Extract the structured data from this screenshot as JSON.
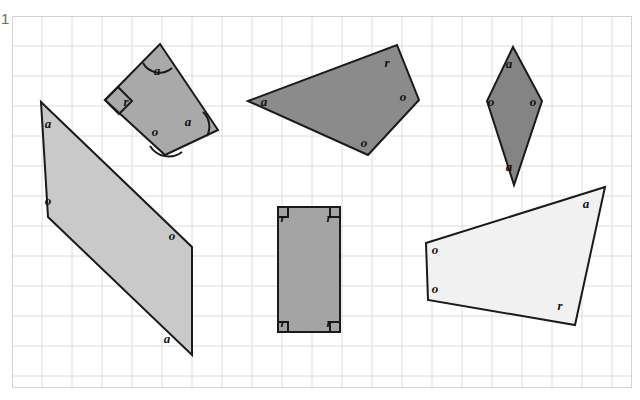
{
  "worksheet": {
    "question_number": "1",
    "grid": {
      "cell_size": 30,
      "line_color": "#dcdcdc",
      "border_color": "#d2d2d2",
      "origin_x": 12,
      "origin_y": 16,
      "width": 620,
      "height": 372
    },
    "legend_meaning": {
      "a": "acute angle",
      "o": "obtuse angle",
      "r": "right angle"
    },
    "shapes": [
      {
        "name": "shape-quadrilateral-top-left",
        "fill": "#a9a9a9",
        "stroke": "#1a1a1a",
        "points": "148,28 206,114 153,139 93,84",
        "labels": [
          {
            "text": "a",
            "x": 145,
            "y": 59
          },
          {
            "text": "r",
            "x": 114,
            "y": 90
          },
          {
            "text": "o",
            "x": 143,
            "y": 120
          },
          {
            "text": "a",
            "x": 176,
            "y": 110
          }
        ],
        "arcs": [
          {
            "d": "M 131 47 A 19 19 0 0 0 160 52"
          },
          {
            "d": "M 138 130 A 22 22 0 0 0 170 136"
          },
          {
            "d": "M 191 96 A 20 20 0 0 1 195 120"
          }
        ],
        "right_angle_marks": [
          {
            "points": "93,84 106,71 120,85 107,98"
          }
        ]
      },
      {
        "name": "shape-parallelogram-left",
        "fill": "#c9c9c9",
        "stroke": "#1a1a1a",
        "points": "29,86 180,231 180,339 36,201",
        "labels": [
          {
            "text": "a",
            "x": 36,
            "y": 112
          },
          {
            "text": "o",
            "x": 36,
            "y": 189
          },
          {
            "text": "o",
            "x": 160,
            "y": 224
          },
          {
            "text": "a",
            "x": 155,
            "y": 327
          }
        ],
        "arcs": [],
        "right_angle_marks": []
      },
      {
        "name": "shape-quadrilateral-top-middle",
        "fill": "#8b8b8b",
        "stroke": "#1a1a1a",
        "points": "236,85 385,29 407,84 356,139",
        "labels": [
          {
            "text": "a",
            "x": 252,
            "y": 90
          },
          {
            "text": "r",
            "x": 375,
            "y": 51
          },
          {
            "text": "o",
            "x": 391,
            "y": 85
          },
          {
            "text": "o",
            "x": 352,
            "y": 131
          }
        ],
        "arcs": [],
        "right_angle_marks": []
      },
      {
        "name": "shape-kite-top-right",
        "fill": "#848484",
        "stroke": "#1a1a1a",
        "points": "501,31 530,85 502,169 475,85",
        "labels": [
          {
            "text": "a",
            "x": 497,
            "y": 52
          },
          {
            "text": "o",
            "x": 479,
            "y": 90
          },
          {
            "text": "o",
            "x": 521,
            "y": 90
          },
          {
            "text": "a",
            "x": 497,
            "y": 155
          }
        ],
        "arcs": [],
        "right_angle_marks": []
      },
      {
        "name": "shape-rectangle-bottom-middle",
        "fill": "#a4a4a4",
        "stroke": "#1a1a1a",
        "points": "266,191 328,191 328,316 266,316",
        "labels": [
          {
            "text": "r",
            "x": 271,
            "y": 206
          },
          {
            "text": "r",
            "x": 317,
            "y": 206
          },
          {
            "text": "r",
            "x": 271,
            "y": 311
          },
          {
            "text": "r",
            "x": 317,
            "y": 311
          }
        ],
        "arcs": [],
        "right_angle_marks": [
          {
            "points": "266,191 276,191 276,201 266,201"
          },
          {
            "points": "328,191 318,191 318,201 328,201"
          },
          {
            "points": "266,316 276,316 276,306 266,306"
          },
          {
            "points": "328,316 318,316 318,306 328,306"
          }
        ]
      },
      {
        "name": "shape-quadrilateral-bottom-right",
        "fill": "#f1f1f1",
        "stroke": "#1a1a1a",
        "points": "414,227 593,171 563,309 416,284",
        "labels": [
          {
            "text": "a",
            "x": 574,
            "y": 192
          },
          {
            "text": "o",
            "x": 423,
            "y": 238
          },
          {
            "text": "o",
            "x": 423,
            "y": 277
          },
          {
            "text": "r",
            "x": 548,
            "y": 294
          }
        ],
        "arcs": [],
        "right_angle_marks": []
      }
    ]
  }
}
